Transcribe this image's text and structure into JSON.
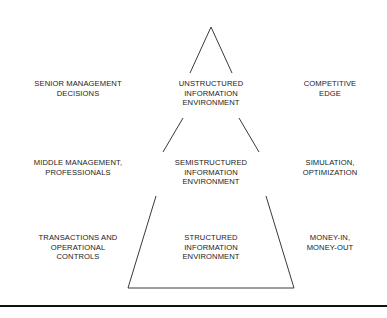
{
  "diagram": {
    "type": "pyramid-diagram",
    "line_color": "#3a3a3a",
    "text_color": "#1a1a1a",
    "rule_color": "#111111",
    "rows": [
      {
        "id": "top",
        "left": {
          "lines": [
            "SENIOR MANAGEMENT",
            "DECISIONS"
          ]
        },
        "center": {
          "lines": [
            "UNSTRUCTURED",
            "INFORMATION",
            "ENVIRONMENT"
          ]
        },
        "right": {
          "lines": [
            "COMPETITIVE",
            "EDGE"
          ]
        }
      },
      {
        "id": "middle",
        "left": {
          "lines": [
            "MIDDLE MANAGEMENT,",
            "PROFESSIONALS"
          ]
        },
        "center": {
          "lines": [
            "SEMISTRUCTURED",
            "INFORMATION",
            "ENVIRONMENT"
          ]
        },
        "right": {
          "lines": [
            "SIMULATION,",
            "OPTIMIZATION"
          ]
        }
      },
      {
        "id": "bottom",
        "left": {
          "lines": [
            "TRANSACTIONS AND",
            "OPERATIONAL",
            "CONTROLS"
          ]
        },
        "center": {
          "lines": [
            "STRUCTURED",
            "INFORMATION",
            "ENVIRONMENT"
          ]
        },
        "right": {
          "lines": [
            "MONEY-IN,",
            "MONEY-OUT"
          ]
        }
      }
    ]
  }
}
